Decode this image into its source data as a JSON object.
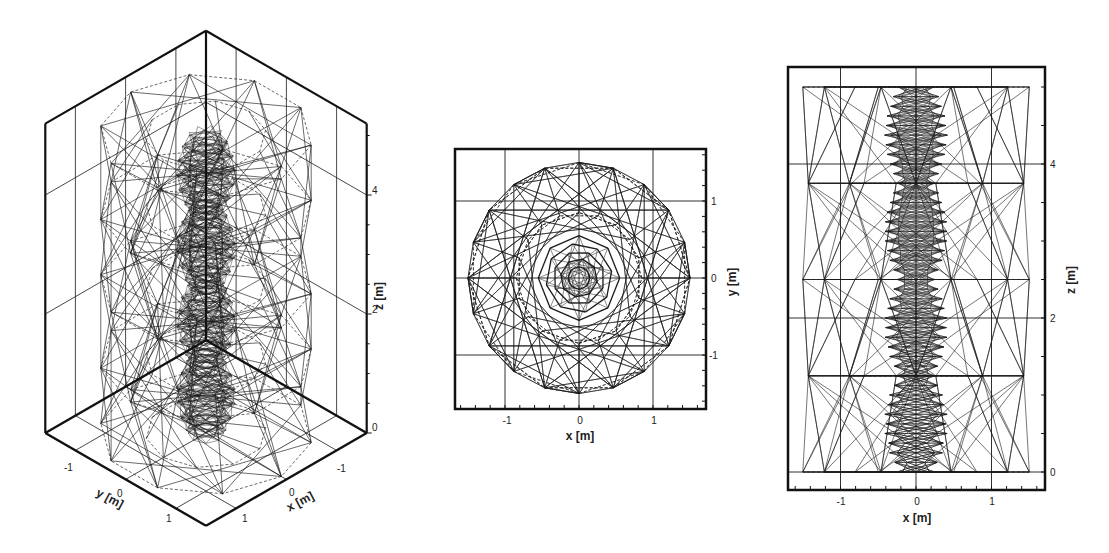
{
  "chart_data": [
    {
      "type": "wireframe-3d",
      "panel": "isometric",
      "title": "",
      "xlabel": "x [m]",
      "ylabel": "y [m]",
      "zlabel": "z [m]",
      "x_ticks": [
        "-1",
        "0",
        "1"
      ],
      "y_ticks": [
        "-1",
        "0",
        "1"
      ],
      "z_ticks": [
        "0",
        "2",
        "4"
      ],
      "xlim": [
        -1.6,
        1.6
      ],
      "ylim": [
        -1.6,
        1.6
      ],
      "zlim": [
        0,
        5.2
      ],
      "grid": true,
      "description": "3D truss/lattice wireframe: decagonal outer shell (radius ~1.5 m) with dense inner core (radius ~0.4 m), height ~5 m"
    },
    {
      "type": "wireframe-2d",
      "panel": "top-view",
      "title": "",
      "xlabel": "x [m]",
      "ylabel": "y [m]",
      "x_ticks": [
        "-1",
        "0",
        "1"
      ],
      "y_ticks": [
        "-1",
        "0",
        "1"
      ],
      "xlim": [
        -1.7,
        1.7
      ],
      "ylim": [
        -1.7,
        1.7
      ],
      "grid": true,
      "description": "Top (x-y) projection: 10-sided outer polygon radius ~1.5 m, inner nested octagons radius ~0.5 m"
    },
    {
      "type": "wireframe-2d",
      "panel": "side-view",
      "title": "",
      "xlabel": "x [m]",
      "ylabel": "z [m]",
      "x_ticks": [
        "-1",
        "0",
        "1"
      ],
      "y_ticks": [
        "0",
        "2",
        "4"
      ],
      "xlim": [
        -1.7,
        1.7
      ],
      "ylim": [
        -0.35,
        5.2
      ],
      "grid": true,
      "description": "Side (x-z) projection: lattice from z=0 to z=5 m, x from -1.5 to 1.5 m, dense core between x=-0.45 and 0.45"
    }
  ],
  "panels": {
    "iso": {
      "xlabel": "x [m]",
      "ylabel": "y [m]",
      "zlabel": "z [m]",
      "x_ticks": [
        "-1",
        "0",
        "1"
      ],
      "y_ticks": [
        "-1",
        "0",
        "1"
      ],
      "z_ticks": [
        "0",
        "2",
        "4"
      ]
    },
    "top": {
      "xlabel": "x [m]",
      "ylabel": "y [m]",
      "x_ticks": [
        "-1",
        "0",
        "1"
      ],
      "y_ticks": [
        "1",
        "0",
        "-1"
      ]
    },
    "side": {
      "xlabel": "x [m]",
      "ylabel": "z [m]",
      "x_ticks": [
        "-1",
        "0",
        "1"
      ],
      "y_ticks": [
        "4",
        "2",
        "0"
      ]
    }
  },
  "colors": {
    "line": "#1a1a1a",
    "frame": "#111111",
    "background": "#ffffff"
  }
}
